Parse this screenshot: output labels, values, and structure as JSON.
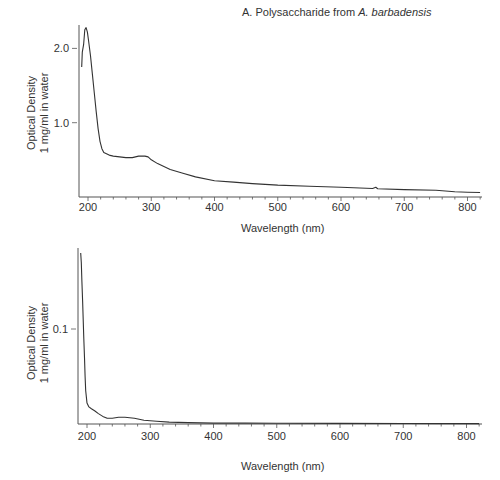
{
  "chart_data": [
    {
      "type": "line",
      "title": "A. Polysaccharide from A. barbadensis",
      "title_plain": "A. Polysaccharide from ",
      "title_italic": "A. barbadensis",
      "xlabel": "Wavelength (nm)",
      "ylabel_line1": "Optical Density",
      "ylabel_line2": "1 mg/ml in water",
      "xlim": [
        185,
        822
      ],
      "ylim": [
        0,
        2.35
      ],
      "x_ticks": [
        200,
        300,
        400,
        500,
        600,
        700,
        800
      ],
      "y_ticks": [
        1.0,
        2.0
      ],
      "y_tick_labels": [
        "1.0",
        "2.0"
      ],
      "grid": false,
      "series": [
        {
          "name": "Polysaccharide from A. barbadensis",
          "x": [
            190,
            191,
            193,
            195,
            197,
            199,
            201,
            204,
            207,
            210,
            213,
            216,
            219,
            222,
            225,
            230,
            235,
            240,
            250,
            260,
            270,
            280,
            290,
            295,
            300,
            310,
            320,
            330,
            350,
            370,
            400,
            430,
            460,
            500,
            550,
            600,
            650,
            655,
            658,
            700,
            750,
            780,
            800,
            820
          ],
          "y": [
            1.75,
            1.95,
            2.05,
            2.25,
            2.28,
            2.22,
            2.1,
            1.9,
            1.65,
            1.4,
            1.15,
            0.92,
            0.75,
            0.65,
            0.6,
            0.58,
            0.56,
            0.55,
            0.54,
            0.53,
            0.53,
            0.55,
            0.55,
            0.54,
            0.5,
            0.45,
            0.41,
            0.37,
            0.32,
            0.27,
            0.22,
            0.2,
            0.18,
            0.16,
            0.145,
            0.13,
            0.115,
            0.13,
            0.11,
            0.1,
            0.09,
            0.07,
            0.065,
            0.06
          ]
        }
      ]
    },
    {
      "type": "line",
      "title": "",
      "xlabel": "Wavelength (nm)",
      "ylabel_line1": "Optical Density",
      "ylabel_line2": "1 mg/ml in water",
      "xlim": [
        185,
        822
      ],
      "ylim": [
        0,
        0.183
      ],
      "x_ticks": [
        200,
        300,
        400,
        500,
        600,
        700,
        800
      ],
      "y_ticks": [
        0.1
      ],
      "y_tick_labels": [
        "0.1"
      ],
      "grid": false,
      "series": [
        {
          "name": "Blank / water",
          "x": [
            190,
            191,
            192,
            193,
            194,
            195,
            196,
            197,
            198,
            200,
            203,
            207,
            212,
            218,
            225,
            232,
            240,
            250,
            260,
            275,
            290,
            310,
            330,
            360,
            400,
            450,
            500,
            600,
            700,
            820
          ],
          "y": [
            0.18,
            0.17,
            0.15,
            0.13,
            0.11,
            0.09,
            0.07,
            0.05,
            0.035,
            0.022,
            0.018,
            0.016,
            0.014,
            0.011,
            0.008,
            0.006,
            0.006,
            0.007,
            0.007,
            0.006,
            0.004,
            0.003,
            0.002,
            0.0015,
            0.001,
            0.001,
            0.0008,
            0.0006,
            0.0005,
            0.0004
          ]
        }
      ]
    }
  ]
}
